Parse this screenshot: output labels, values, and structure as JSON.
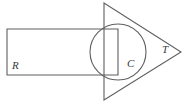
{
  "figure": {
    "background_color": "#ffffff",
    "stroke_color": "#5f5f5f",
    "label_color": "#3a3a3a",
    "width": 186,
    "height": 106,
    "shapes": [
      {
        "id": "rectangle",
        "kind": "rectangle",
        "label": "R",
        "label_x": 12,
        "label_y": 69,
        "x": 7,
        "y": 29,
        "width": 111,
        "height": 46
      },
      {
        "id": "circle",
        "kind": "circle",
        "label": "C",
        "label_x": 127,
        "label_y": 67,
        "cx": 118,
        "cy": 52,
        "r": 28
      },
      {
        "id": "triangle",
        "kind": "triangle",
        "label": "T",
        "label_x": 162,
        "label_y": 53,
        "points": "104,3 104,100 181,52"
      }
    ]
  }
}
